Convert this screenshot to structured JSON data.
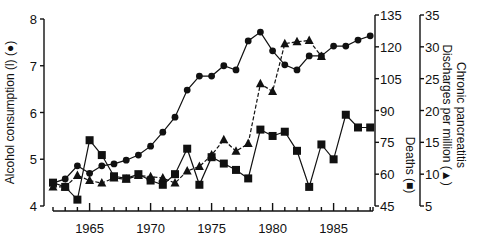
{
  "chart_data": {
    "type": "line",
    "title": "",
    "xlabel": "",
    "x": [
      1962,
      1963,
      1964,
      1965,
      1966,
      1967,
      1968,
      1969,
      1970,
      1971,
      1972,
      1973,
      1974,
      1975,
      1976,
      1977,
      1978,
      1979,
      1980,
      1981,
      1982,
      1983,
      1984,
      1985,
      1986,
      1987,
      1988
    ],
    "x_ticks": [
      "1965",
      "1970",
      "1975",
      "1980",
      "1985"
    ],
    "xlim": [
      1962,
      1988
    ],
    "axes": {
      "left": {
        "label": "Alcohol consumption (l) (●)",
        "ticks": [
          "4",
          "5",
          "6",
          "7",
          "8"
        ],
        "range": [
          4,
          8
        ]
      },
      "right1": {
        "label": "Deaths (■)",
        "ticks": [
          "45",
          "60",
          "75",
          "90",
          "105",
          "120",
          "135"
        ],
        "range": [
          45,
          135
        ]
      },
      "right2": {
        "label": "Chronic pancreatitis Discharges per million (▲)",
        "ticks": [
          "5",
          "10",
          "15",
          "20",
          "25",
          "30",
          "35"
        ],
        "range": [
          5,
          35
        ]
      }
    },
    "series": [
      {
        "name": "Alcohol consumption (l)",
        "marker": "circle",
        "axis": "left",
        "style": "solid",
        "values": [
          4.49,
          4.58,
          4.86,
          4.7,
          4.86,
          4.9,
          4.98,
          5.09,
          5.28,
          5.58,
          5.9,
          6.48,
          6.78,
          6.78,
          7.0,
          6.91,
          7.53,
          7.72,
          7.32,
          7.02,
          6.91,
          7.21,
          7.21,
          7.42,
          7.42,
          7.55,
          7.64
        ]
      },
      {
        "name": "Deaths",
        "marker": "square",
        "axis": "right1",
        "style": "solid",
        "values": [
          56,
          54,
          48,
          76,
          69,
          59,
          58,
          60,
          57,
          55,
          60,
          72,
          55,
          68,
          65,
          62,
          58,
          81,
          78,
          80,
          71,
          54,
          74,
          67,
          88,
          82,
          82
        ]
      },
      {
        "name": "Chronic pancreatitis discharges per million",
        "marker": "triangle",
        "axis": "right2",
        "style": "dashed",
        "values": [
          8,
          8,
          9.8,
          9,
          8.6,
          9.4,
          9.2,
          9.8,
          9.6,
          9.4,
          8.6,
          10.5,
          11.2,
          13,
          15.4,
          13.6,
          14.8,
          24.2,
          23,
          30.5,
          30.8,
          31,
          28.5,
          null,
          null,
          null,
          null
        ]
      }
    ],
    "grid": false,
    "legend": "none (markers identified in axis labels)"
  }
}
